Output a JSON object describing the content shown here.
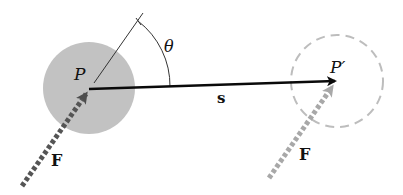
{
  "diagram": {
    "type": "work-done-by-force",
    "labels": {
      "point_start": "P",
      "point_end": "P′",
      "displacement": "s",
      "force_start": "F",
      "force_end": "F",
      "angle": "θ"
    },
    "colors": {
      "body_fill": "#c2c2c2",
      "displacement_arrow": "#0a0a0a",
      "force_start_arrow": "#5a5a5a",
      "force_end_arrow": "#a8a8a8",
      "ghost_circle": "#bdbdbd",
      "angle_lines": "#333333"
    },
    "geometry": {
      "start_point": [
        89,
        89
      ],
      "end_point": [
        335,
        81
      ],
      "body_radius": 46
    }
  }
}
